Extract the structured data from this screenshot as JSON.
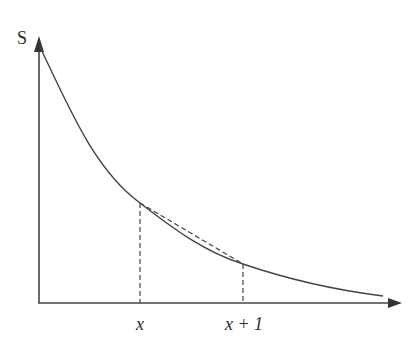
{
  "diagram": {
    "type": "function-curve",
    "y_axis_label": "S",
    "x_tick_labels": [
      {
        "label": "x",
        "italic": true
      },
      {
        "label": "x + 1",
        "italic": true
      }
    ],
    "colors": {
      "stroke": "#333333",
      "background": "#ffffff"
    },
    "geometry": {
      "origin": [
        39,
        303
      ],
      "y_axis_top": [
        39,
        38
      ],
      "x_axis_right": [
        400,
        303
      ],
      "curve_start": [
        40,
        47
      ],
      "point_x": [
        140,
        203
      ],
      "point_x_plus_1": [
        243,
        264
      ],
      "curve_end": [
        383,
        296
      ]
    }
  }
}
